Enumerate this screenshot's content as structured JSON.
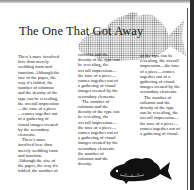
{
  "document": {
    "title": "The One That Got Away",
    "columns": [
      {
        "paragraphs": [
          "There's more involved here than merely wedding form and function. Although the size of the paper, the way it's folded, the number of columns and the density of the type can be revealing, the overall impression—the tone of a piece—comes together out of a gathering of visual images created by the secondary elements.",
          "There's more involved here than merely wedding form and function. Although the size of the paper, the way it's folded, the number of"
        ]
      },
      {
        "paragraphs": [
          "columns and the density of the type can be revealing, the overall impression—the tone of a piece—comes together out of a gathering of visual images created by the secondary elements.",
          "The number of columns and the density of the type can be revealing, the overall impression—the tone of a piece—comes together out of a gathering of visual images created by the secondary elements the number of columns and the density."
        ]
      },
      {
        "paragraphs": [
          "of the type can be revealing, the overall impression—the tone of a piece—comes together out of a gathering of visual images created by the secondary elements.",
          "The number of columns and the density of the type can be revealing, the overall impression—the tone of a piece—comes together out of a gathering of visual."
        ]
      }
    ],
    "images": {
      "background_fish": "halftone-bass-fish",
      "foreground_fish": "black-silhouette-bass-fish"
    }
  }
}
